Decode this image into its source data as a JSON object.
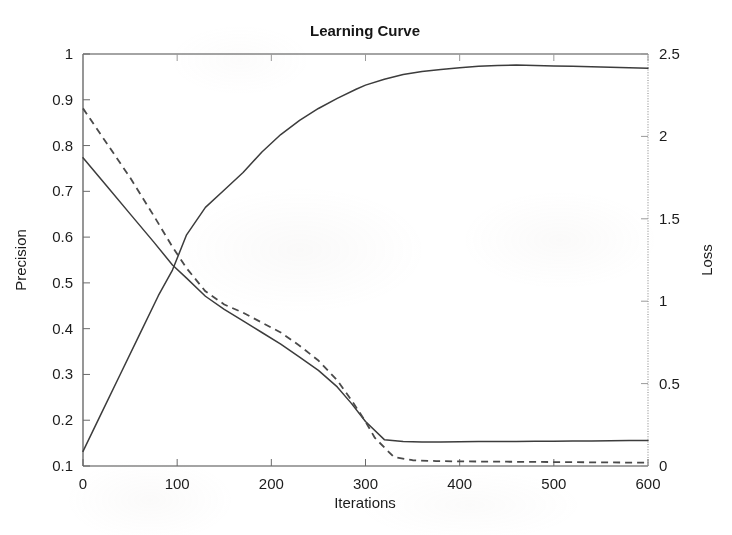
{
  "chart_data": {
    "type": "line",
    "title": "Learning Curve",
    "xlabel": "Iterations",
    "ylabel": "Precision",
    "ylabel_right": "Loss",
    "xlim": [
      0,
      600
    ],
    "ylim": [
      0.1,
      1
    ],
    "ylim_right": [
      0,
      2.5
    ],
    "grid": false,
    "legend": "none",
    "x_ticks": [
      "0",
      "100",
      "200",
      "300",
      "400",
      "500",
      "600"
    ],
    "y_ticks_left": [
      "0.1",
      "0.2",
      "0.3",
      "0.4",
      "0.5",
      "0.6",
      "0.7",
      "0.8",
      "0.9",
      "1"
    ],
    "y_ticks_right": [
      "0",
      "0.5",
      "1",
      "1.5",
      "2",
      "2.5"
    ],
    "x_tick_values": [
      0,
      100,
      200,
      300,
      400,
      500,
      600
    ],
    "y_tick_values_left": [
      0.1,
      0.2,
      0.3,
      0.4,
      0.5,
      0.6,
      0.7,
      0.8,
      0.9,
      1
    ],
    "y_tick_values_right": [
      0,
      0.5,
      1,
      1.5,
      2,
      2.5
    ],
    "series": [
      {
        "name": "Precision",
        "axis": "left",
        "style": "solid",
        "x": [
          0,
          20,
          40,
          60,
          80,
          95,
          110,
          130,
          150,
          170,
          190,
          210,
          230,
          250,
          270,
          290,
          300,
          320,
          340,
          360,
          380,
          400,
          420,
          440,
          460,
          480,
          500,
          520,
          540,
          560,
          580,
          600
        ],
        "y": [
          0.132,
          0.217,
          0.302,
          0.387,
          0.472,
          0.528,
          0.605,
          0.665,
          0.703,
          0.741,
          0.786,
          0.824,
          0.855,
          0.881,
          0.903,
          0.923,
          0.932,
          0.945,
          0.955,
          0.962,
          0.966,
          0.97,
          0.973,
          0.975,
          0.976,
          0.975,
          0.974,
          0.973,
          0.972,
          0.971,
          0.97,
          0.969
        ]
      },
      {
        "name": "Loss (training)",
        "axis": "right",
        "style": "solid",
        "x": [
          0,
          25,
          50,
          75,
          95,
          110,
          130,
          150,
          170,
          190,
          210,
          230,
          250,
          270,
          285,
          300,
          320,
          340,
          360,
          380,
          400,
          420,
          440,
          460,
          480,
          500,
          520,
          540,
          560,
          580,
          600
        ],
        "y": [
          1.87,
          1.7,
          1.53,
          1.36,
          1.22,
          1.14,
          1.03,
          0.95,
          0.88,
          0.81,
          0.74,
          0.66,
          0.58,
          0.48,
          0.38,
          0.27,
          0.16,
          0.148,
          0.146,
          0.146,
          0.147,
          0.148,
          0.148,
          0.149,
          0.15,
          0.15,
          0.151,
          0.152,
          0.153,
          0.154,
          0.155
        ]
      },
      {
        "name": "Loss (validation)",
        "axis": "right",
        "style": "dashed",
        "x": [
          0,
          25,
          50,
          75,
          95,
          110,
          130,
          150,
          170,
          190,
          210,
          230,
          250,
          270,
          285,
          300,
          310,
          330,
          350,
          375,
          400,
          425,
          450,
          475,
          500,
          525,
          550,
          575,
          600
        ],
        "y": [
          2.17,
          1.96,
          1.75,
          1.52,
          1.33,
          1.2,
          1.06,
          0.98,
          0.93,
          0.87,
          0.81,
          0.73,
          0.64,
          0.52,
          0.4,
          0.27,
          0.17,
          0.055,
          0.035,
          0.03,
          0.028,
          0.027,
          0.026,
          0.025,
          0.024,
          0.023,
          0.022,
          0.021,
          0.02
        ]
      }
    ]
  }
}
